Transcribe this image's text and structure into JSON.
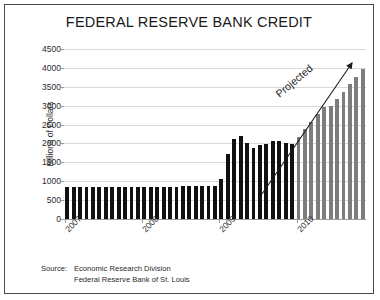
{
  "chart_data": {
    "type": "bar",
    "title": "FEDERAL RESERVE BANK CREDIT",
    "xlabel": "",
    "ylabel": "Billions of Dollars",
    "ylim": [
      0,
      4500
    ],
    "ytick_values": [
      0,
      500,
      1000,
      1500,
      2000,
      2500,
      3000,
      3500,
      4000,
      4500
    ],
    "ytick_labels": [
      "0",
      "500",
      "1000",
      "1500",
      "2000",
      "2500",
      "3000",
      "3500",
      "4000",
      "4500"
    ],
    "grid": true,
    "legend": "none",
    "xtick_labels": [
      "2007",
      "2008",
      "2009",
      "2010"
    ],
    "xtick_positions": [
      0,
      12,
      24,
      36
    ],
    "annotation": "Projected",
    "series": [
      {
        "name": "Actual",
        "color": "#111111",
        "values": [
          850,
          850,
          850,
          850,
          850,
          850,
          850,
          850,
          850,
          850,
          850,
          850,
          855,
          855,
          855,
          860,
          860,
          860,
          865,
          865,
          870,
          870,
          875,
          880,
          1050,
          1730,
          2110,
          2190,
          2020,
          1870,
          1960,
          1975,
          2070,
          2075,
          2010,
          1985
        ]
      },
      {
        "name": "Projected",
        "color": "#7d7d7d",
        "values": [
          2180,
          2370,
          2570,
          2780,
          2965,
          2980,
          3170,
          3360,
          3570,
          3770,
          3980
        ]
      }
    ],
    "actual_start_label": "2007",
    "projected_start_index": 36,
    "total_bars": 47
  },
  "source": {
    "label": "Source:",
    "line1": "Economic Research Division",
    "line2": "Federal Reserve Bank of St. Louis"
  },
  "colors": {
    "actual_bar": "#111111",
    "projected_bar": "#7d7d7d",
    "grid": "#d9d9d9",
    "axis": "#9a9a9a",
    "border": "#4a4a4a",
    "text": "#1a1a1a"
  }
}
